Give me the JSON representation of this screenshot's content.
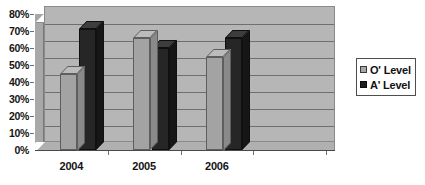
{
  "chart_data": {
    "type": "bar",
    "title": "",
    "subtitle": "",
    "xlabel": "",
    "ylabel": "",
    "categories": [
      "2004",
      "2005",
      "2006"
    ],
    "series": [
      {
        "name": "O' Level",
        "values": [
          45,
          66,
          55
        ],
        "color": "#a3a3a3"
      },
      {
        "name": "A' Level",
        "values": [
          71,
          60,
          66
        ],
        "color": "#262626"
      }
    ],
    "ylim": [
      0,
      80
    ],
    "ytick_step": 10,
    "ytick_labels": [
      "0%",
      "10%",
      "20%",
      "30%",
      "40%",
      "50%",
      "60%",
      "70%",
      "80%"
    ],
    "ytick_values": [
      0,
      10,
      20,
      30,
      40,
      50,
      60,
      70,
      80
    ],
    "grid": true,
    "grid_axis": "y",
    "legend_position": "right",
    "style": "3d-grayscale",
    "value_suffix": "%"
  },
  "legend": {
    "entries": [
      {
        "label": "O' Level",
        "swatch": "light-gray-swatch"
      },
      {
        "label": "A' Level",
        "swatch": "dark-gray-swatch"
      }
    ]
  },
  "colors": {
    "plot_back_wall": "#b6b6b6",
    "plot_side_wall": "#a8a8a8",
    "gridline": "#6f6f6f",
    "series_light": "#a3a3a3",
    "series_dark": "#262626",
    "text": "#141414",
    "background": "#ffffff"
  }
}
